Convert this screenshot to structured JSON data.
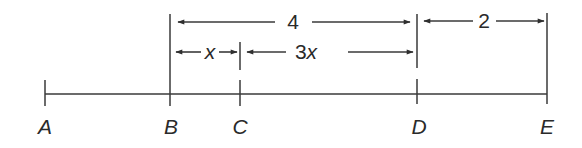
{
  "diagram": {
    "type": "number-line-segment",
    "colors": {
      "stroke": "#3a3a3a",
      "text": "#2a2a2a",
      "background": "#ffffff"
    },
    "points": [
      {
        "label": "A",
        "x": 45
      },
      {
        "label": "B",
        "x": 170
      },
      {
        "label": "C",
        "x": 240
      },
      {
        "label": "D",
        "x": 417
      },
      {
        "label": "E",
        "x": 547
      }
    ],
    "dimensions": [
      {
        "id": "BD",
        "from": "B",
        "to": "D",
        "label": "4",
        "row": 1
      },
      {
        "id": "DE",
        "from": "D",
        "to": "E",
        "label": "2",
        "row": 1
      },
      {
        "id": "BC",
        "from": "B",
        "to": "C",
        "label_num": "",
        "label_var": "x",
        "row": 2
      },
      {
        "id": "CD",
        "from": "C",
        "to": "D",
        "label_num": "3",
        "label_var": "x",
        "row": 2
      }
    ]
  }
}
